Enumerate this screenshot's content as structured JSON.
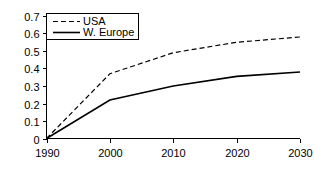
{
  "chart_data": {
    "type": "line",
    "title": "",
    "xlabel": "",
    "ylabel": "",
    "x": [
      1990,
      2000,
      2010,
      2020,
      2030
    ],
    "xlim": [
      1990,
      2030
    ],
    "ylim": [
      0,
      0.7
    ],
    "xticks": [
      "1990",
      "2000",
      "2010",
      "2020",
      "2030"
    ],
    "yticks": [
      "0",
      "0.1",
      "0.2",
      "0.3",
      "0.4",
      "0.5",
      "0.6",
      "0.7"
    ],
    "ytick_values": [
      0,
      0.1,
      0.2,
      0.3,
      0.4,
      0.5,
      0.6,
      0.7
    ],
    "grid": false,
    "legend_position": "upper left",
    "series": [
      {
        "name": "USA",
        "style": "dashed",
        "color": "#000000",
        "values": [
          0,
          0.37,
          0.49,
          0.55,
          0.58
        ]
      },
      {
        "name": "W. Europe",
        "style": "solid",
        "color": "#000000",
        "values": [
          0,
          0.22,
          0.3,
          0.355,
          0.38
        ]
      }
    ]
  },
  "legend": {
    "entries": [
      {
        "label": "USA"
      },
      {
        "label": "W. Europe"
      }
    ]
  }
}
